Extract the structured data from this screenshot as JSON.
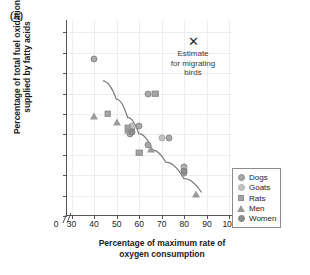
{
  "panel": {
    "label": "(A)"
  },
  "axes": {
    "ylabel_line1": "Percentage of total fuel oxidation",
    "ylabel_line2": "supplied by fatty acids",
    "xlabel_line1": "Percentage of maximum rate of",
    "xlabel_line2": "oxygen consumption",
    "y_ticks": [
      "0",
      "10",
      "20",
      "30",
      "40",
      "50",
      "60",
      "70",
      "80",
      "90"
    ],
    "x_ticks": [
      "0",
      "30",
      "40",
      "50",
      "60",
      "70",
      "80",
      "90",
      "100"
    ]
  },
  "annotation": {
    "marker": "✕",
    "line1": "Estimate",
    "line2": "for migrating",
    "line3": "birds"
  },
  "legend": {
    "items": [
      {
        "label": "Dogs",
        "marker": "circle-open",
        "color": "#a8a8a8"
      },
      {
        "label": "Goats",
        "marker": "circle-light",
        "color": "#c3c3c3"
      },
      {
        "label": "Rats",
        "marker": "square",
        "color": "#a6a6a6"
      },
      {
        "label": "Men",
        "marker": "triangle",
        "color": "#9a9a9a"
      },
      {
        "label": "Women",
        "marker": "circle-filled",
        "color": "#8f8f8f"
      }
    ]
  },
  "chart_data": {
    "type": "scatter",
    "title": "",
    "xlabel": "Percentage of maximum rate of oxygen consumption",
    "ylabel": "Percentage of total fuel oxidation supplied by fatty acids",
    "xlim": [
      28,
      102
    ],
    "ylim": [
      0,
      96
    ],
    "xticks": [
      30,
      40,
      50,
      60,
      70,
      80,
      90,
      100
    ],
    "yticks": [
      0,
      10,
      20,
      30,
      40,
      50,
      60,
      70,
      80,
      90
    ],
    "grid": true,
    "axis_break_x": true,
    "legend_position": "bottom-right",
    "series": [
      {
        "name": "Dogs",
        "marker": "circle-open",
        "points": [
          {
            "x": 40,
            "y": 77
          },
          {
            "x": 64,
            "y": 60
          },
          {
            "x": 60,
            "y": 44
          },
          {
            "x": 57,
            "y": 43
          },
          {
            "x": 56,
            "y": 40
          },
          {
            "x": 73,
            "y": 38
          },
          {
            "x": 64,
            "y": 35
          },
          {
            "x": 80,
            "y": 24
          },
          {
            "x": 80,
            "y": 21
          }
        ]
      },
      {
        "name": "Goats",
        "marker": "circle-light",
        "points": [
          {
            "x": 57,
            "y": 44
          },
          {
            "x": 70,
            "y": 38
          },
          {
            "x": 80,
            "y": 23
          }
        ]
      },
      {
        "name": "Rats",
        "marker": "square",
        "points": [
          {
            "x": 46,
            "y": 50
          },
          {
            "x": 67,
            "y": 60
          },
          {
            "x": 55,
            "y": 43
          },
          {
            "x": 60,
            "y": 31
          }
        ]
      },
      {
        "name": "Men",
        "marker": "triangle",
        "points": [
          {
            "x": 40,
            "y": 49
          },
          {
            "x": 50,
            "y": 46
          },
          {
            "x": 55,
            "y": 42
          },
          {
            "x": 65,
            "y": 33
          },
          {
            "x": 85,
            "y": 11
          }
        ]
      },
      {
        "name": "Women",
        "marker": "circle-filled",
        "points": [
          {
            "x": 57,
            "y": 41
          },
          {
            "x": 80,
            "y": 22
          }
        ]
      }
    ],
    "trend_line": {
      "description": "fitted declining curve",
      "points": [
        {
          "x": 44,
          "y": 66
        },
        {
          "x": 50,
          "y": 57
        },
        {
          "x": 55,
          "y": 48
        },
        {
          "x": 60,
          "y": 40
        },
        {
          "x": 66,
          "y": 32
        },
        {
          "x": 72,
          "y": 26
        },
        {
          "x": 80,
          "y": 18
        },
        {
          "x": 88,
          "y": 11
        }
      ]
    },
    "annotations": [
      {
        "text": "Estimate for migrating birds",
        "x": 70,
        "y": 85,
        "marker": "x"
      }
    ]
  }
}
